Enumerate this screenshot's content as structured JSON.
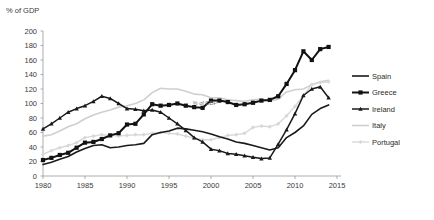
{
  "chart_data": {
    "type": "line",
    "title": "",
    "ylabel": "% of GDP",
    "xlabel": "",
    "inner_label": "% of GDP",
    "ylim": [
      0,
      200
    ],
    "xlim": [
      1980,
      2015
    ],
    "y_ticks": [
      "0",
      "20",
      "40",
      "60",
      "80",
      "100",
      "120",
      "140",
      "160",
      "180",
      "200"
    ],
    "x_ticks": [
      "1980",
      "1985",
      "1990",
      "1995",
      "2000",
      "2005",
      "2010",
      "2015"
    ],
    "grid": false,
    "legend_position": "right",
    "x": [
      1980,
      1981,
      1982,
      1983,
      1984,
      1985,
      1986,
      1987,
      1988,
      1989,
      1990,
      1991,
      1992,
      1993,
      1994,
      1995,
      1996,
      1997,
      1998,
      1999,
      2000,
      2001,
      2002,
      2003,
      2004,
      2005,
      2006,
      2007,
      2008,
      2009,
      2010,
      2011,
      2012,
      2013,
      2014
    ],
    "series": [
      {
        "name": "Spain",
        "color": "#1a1a1a",
        "width": 1.6,
        "marker": "none",
        "values": [
          16,
          19,
          23,
          27,
          33,
          38,
          42,
          43,
          39,
          40,
          42,
          43,
          45,
          57,
          60,
          62,
          66,
          65,
          63,
          61,
          58,
          54,
          51,
          47,
          45,
          42,
          39,
          36,
          39,
          53,
          60,
          69,
          85,
          93,
          98
        ]
      },
      {
        "name": "Greece",
        "color": "#121212",
        "width": 2.0,
        "marker": "square",
        "values": [
          22,
          25,
          29,
          32,
          39,
          46,
          47,
          51,
          56,
          59,
          71,
          72,
          85,
          99,
          97,
          98,
          100,
          97,
          95,
          94,
          104,
          104,
          102,
          98,
          99,
          101,
          104,
          105,
          110,
          127,
          146,
          172,
          160,
          175,
          178
        ]
      },
      {
        "name": "Ireland",
        "color": "#1a1a1a",
        "width": 1.5,
        "marker": "tri",
        "values": [
          65,
          72,
          80,
          88,
          93,
          97,
          103,
          110,
          107,
          100,
          93,
          92,
          90,
          91,
          88,
          80,
          72,
          63,
          53,
          47,
          37,
          35,
          31,
          30,
          28,
          26,
          24,
          25,
          44,
          64,
          86,
          111,
          120,
          123,
          108
        ]
      },
      {
        "name": "Italy",
        "color": "#cfcfcf",
        "width": 1.6,
        "marker": "none",
        "values": [
          55,
          57,
          62,
          68,
          72,
          79,
          84,
          88,
          91,
          95,
          97,
          100,
          105,
          115,
          121,
          120,
          120,
          117,
          113,
          112,
          108,
          108,
          105,
          104,
          103,
          105,
          106,
          103,
          106,
          116,
          119,
          120,
          126,
          130,
          132
        ]
      },
      {
        "name": "Portugal",
        "color": "#d8d8d8",
        "width": 1.4,
        "marker": "diamond",
        "values": [
          30,
          35,
          39,
          42,
          46,
          53,
          55,
          57,
          56,
          55,
          56,
          57,
          57,
          59,
          60,
          59,
          58,
          55,
          52,
          50,
          50,
          53,
          56,
          57,
          59,
          67,
          69,
          68,
          72,
          83,
          96,
          111,
          126,
          129,
          130
        ]
      }
    ]
  },
  "legend": {
    "items": [
      {
        "label": "Spain"
      },
      {
        "label": "Greece"
      },
      {
        "label": "Ireland"
      },
      {
        "label": "Italy"
      },
      {
        "label": "Portugal"
      }
    ]
  }
}
